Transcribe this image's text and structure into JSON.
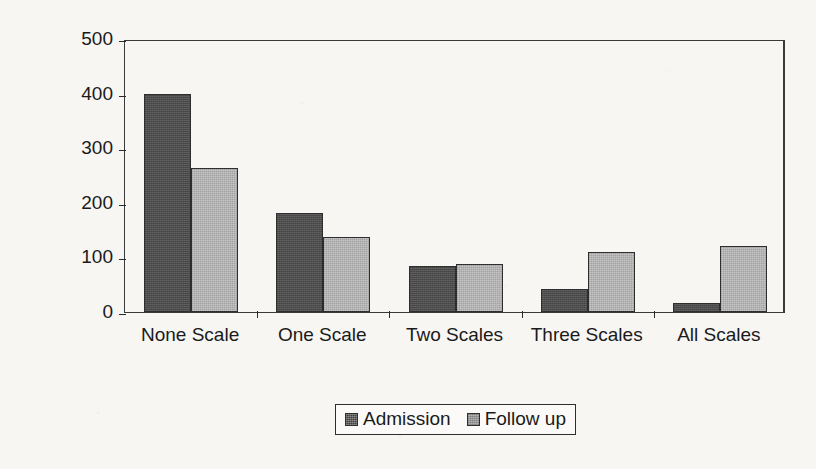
{
  "chart_data": {
    "type": "bar",
    "title": "",
    "xlabel": "",
    "ylabel": "Number of patients",
    "categories": [
      "None Scale",
      "One Scale",
      "Two Scales",
      "Three Scales",
      "All Scales"
    ],
    "series": [
      {
        "name": "Admission",
        "color": "#4d4d4d",
        "values": [
          400,
          182,
          85,
          42,
          16
        ]
      },
      {
        "name": "Follow up",
        "color": "#b4b4b4",
        "values": [
          263,
          138,
          88,
          110,
          120
        ]
      }
    ],
    "ylim": [
      0,
      500
    ],
    "yticks": [
      500,
      400,
      300,
      200,
      100,
      0
    ],
    "ytick_labels": [
      "500",
      "400",
      "300",
      "200",
      "100",
      "0"
    ],
    "grid": false,
    "legend_position": "bottom-center"
  },
  "axis": {
    "y_title": "Number of patients"
  },
  "legend": {
    "entries": [
      {
        "label": "Admission"
      },
      {
        "label": "Follow up"
      }
    ]
  }
}
